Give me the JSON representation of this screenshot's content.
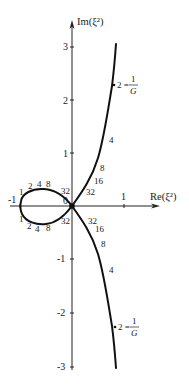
{
  "diagram": {
    "type": "complex-plane-locus",
    "axes": {
      "x_label": "Re(ξ²)",
      "y_label": "Im(ξ²)",
      "x_ticks": [
        "-1",
        "1"
      ],
      "y_ticks": [
        "3",
        "2",
        "1",
        "-1",
        "-2",
        "-3"
      ],
      "origin_label": "0"
    },
    "loop_upper_labels": [
      "1",
      "2",
      "4",
      "8",
      "32"
    ],
    "loop_lower_labels": [
      "1",
      "2",
      "4",
      "8",
      "32"
    ],
    "upper_branch_labels": [
      "32",
      "16",
      "8",
      "4"
    ],
    "lower_branch_labels": [
      "32",
      "16",
      "8",
      "4"
    ],
    "annotation_upper": {
      "lhs": "2 =",
      "num": "1",
      "den": "G"
    },
    "annotation_lower": {
      "lhs": "2 =",
      "num": "1",
      "den": "G"
    }
  }
}
